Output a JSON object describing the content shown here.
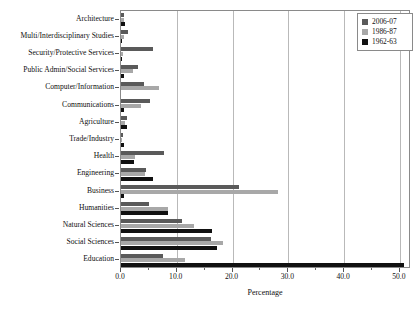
{
  "chart_data": {
    "type": "bar",
    "orientation": "horizontal",
    "title": "",
    "xlabel": "Percentage",
    "ylabel": "",
    "xlim": [
      0.0,
      52.0
    ],
    "xticks": [
      0.0,
      10.0,
      20.0,
      30.0,
      40.0,
      50.0
    ],
    "xtick_labels": [
      "0.0",
      "10.0",
      "20.0",
      "30.0",
      "40.0",
      "50.0"
    ],
    "grid": "vertical",
    "legend_position": "top-right",
    "categories": [
      "Architecture",
      "Multi/Interdisciplinary Studies",
      "Security/Protective Services",
      "Public Admin/Social Services",
      "Computer/Information",
      "Communications",
      "Agriculture",
      "Trade/Industry",
      "Health",
      "Engineering",
      "Business",
      "Humanities",
      "Natural Sciences",
      "Social Sciences",
      "Education"
    ],
    "series": [
      {
        "name": "2006-07",
        "color": "#5a5a5a",
        "values": [
          0.6,
          1.2,
          5.8,
          3.1,
          4.2,
          5.2,
          1.0,
          0.3,
          7.7,
          4.5,
          21.2,
          5.0,
          11.0,
          16.2,
          7.5
        ]
      },
      {
        "name": "1986-87",
        "color": "#a8a8a8",
        "values": [
          0.5,
          0.5,
          0.4,
          2.2,
          6.9,
          3.6,
          0.7,
          0.2,
          2.5,
          4.3,
          28.1,
          8.5,
          13.0,
          18.3,
          11.5
        ]
      },
      {
        "name": "1962-63",
        "color": "#111111",
        "values": [
          0.7,
          0.2,
          0.1,
          0.6,
          0.0,
          0.6,
          1.1,
          0.5,
          2.3,
          5.8,
          0.5,
          8.5,
          16.3,
          17.2,
          50.8
        ]
      }
    ]
  },
  "legend": {
    "entries": [
      {
        "label": "2006-07",
        "swatch": "#5a5a5a"
      },
      {
        "label": "1986-87",
        "swatch": "#a8a8a8"
      },
      {
        "label": "1962-63",
        "swatch": "#111111"
      }
    ]
  }
}
